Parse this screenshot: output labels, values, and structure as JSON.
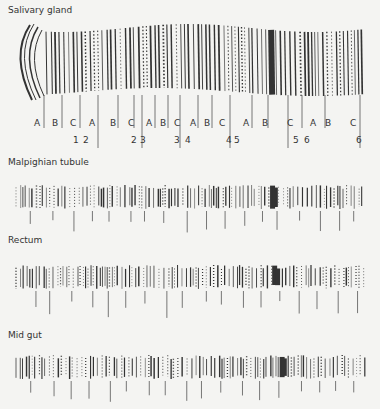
{
  "panels": [
    {
      "title": "Salivary gland"
    },
    {
      "title": "Malpighian tubule"
    },
    {
      "title": "Rectum"
    },
    {
      "title": "Mid gut"
    }
  ],
  "section_labels": [
    "A",
    "B",
    "C",
    "A",
    "B",
    "C",
    "A",
    "B",
    "C",
    "A",
    "B",
    "C",
    "A",
    "B",
    "C",
    "A",
    "B",
    "C"
  ],
  "chromosome_numbers": [
    "1",
    "2",
    "2",
    "3",
    "3",
    "4",
    "4",
    "5",
    "5",
    "6",
    "6"
  ]
}
